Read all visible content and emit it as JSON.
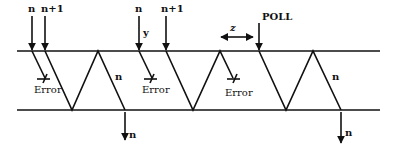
{
  "diagram": {
    "title": "",
    "colors": {
      "stroke": "#111111",
      "background": "#ffffff"
    },
    "arrivals": [
      {
        "label": "n",
        "x": 32
      },
      {
        "label": "n+1",
        "x": 45
      },
      {
        "label": "n",
        "x": 139,
        "side_label": "y"
      },
      {
        "label": "n+1",
        "x": 166
      },
      {
        "label": "POLL",
        "x": 259
      }
    ],
    "error_labels": [
      "Error",
      "Error",
      "Error"
    ],
    "frame_labels": [
      "n",
      "n"
    ],
    "output_labels": [
      "n",
      "n"
    ],
    "interval_label": "z"
  }
}
